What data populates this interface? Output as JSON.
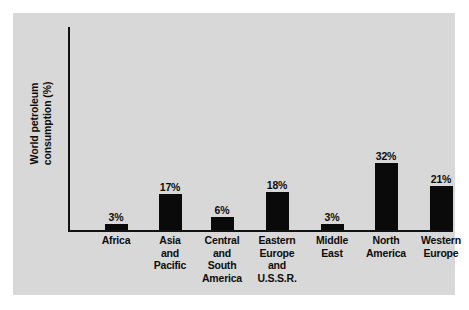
{
  "chart_data": {
    "type": "bar",
    "title": "",
    "subtitle": "",
    "xlabel": "",
    "ylabel": "World petroleum consumption (%)",
    "ylabel_lines": [
      "World petroleum",
      "consumption (%)"
    ],
    "categories": [
      "Africa",
      "Asia and Pacific",
      "Central and South America",
      "Eastern Europe and U.S.S.R.",
      "Middle East",
      "North America",
      "Western Europe"
    ],
    "category_lines": [
      [
        "Africa"
      ],
      [
        "Asia",
        "and",
        "Pacific"
      ],
      [
        "Central",
        "and",
        "South",
        "America"
      ],
      [
        "Eastern",
        "Europe",
        "and",
        "U.S.S.R."
      ],
      [
        "Middle",
        "East"
      ],
      [
        "North",
        "America"
      ],
      [
        "Western",
        "Europe"
      ]
    ],
    "values": [
      3,
      17,
      6,
      18,
      3,
      32,
      21
    ],
    "value_labels": [
      "3%",
      "17%",
      "6%",
      "18%",
      "3%",
      "32%",
      "21%"
    ],
    "ylim": [
      0,
      32
    ],
    "grid": false,
    "legend": false,
    "bar_color": "#0a0a0a",
    "background_color": "#d8d8d8",
    "axis_color": "#121212",
    "text_color": "#0d0d0d"
  }
}
